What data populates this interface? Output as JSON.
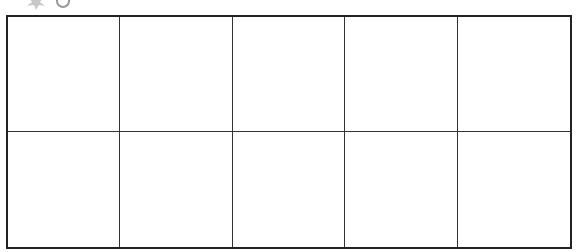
{
  "figure": {
    "type": "empty-grid",
    "rows": 2,
    "columns": 5,
    "cells": [
      [
        "",
        "",
        "",
        "",
        ""
      ],
      [
        "",
        "",
        "",
        "",
        ""
      ]
    ],
    "colors": {
      "border": "#222222",
      "background": "#ffffff",
      "decoration": "#aaaaaa"
    }
  }
}
